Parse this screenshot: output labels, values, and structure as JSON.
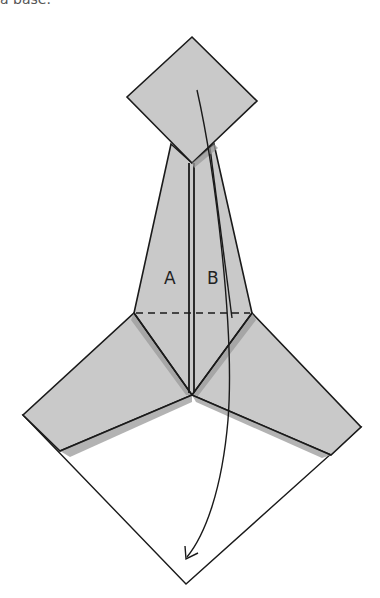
{
  "caption": {
    "partial_text": "a base."
  },
  "diagram": {
    "type": "origami-fold-instruction",
    "labels": [
      {
        "id": "A",
        "text": "A"
      },
      {
        "id": "B",
        "text": "B"
      }
    ],
    "colors": {
      "paper_colored": "#c9c9c9",
      "paper_white": "#ffffff",
      "line": "#1a1a1a",
      "shadow": "#9a9a9a"
    },
    "symbols": {
      "valley_fold_line": "dashed horizontal line across neck",
      "fold_arrow": "curved arrow from top diamond down to bottom point"
    }
  }
}
